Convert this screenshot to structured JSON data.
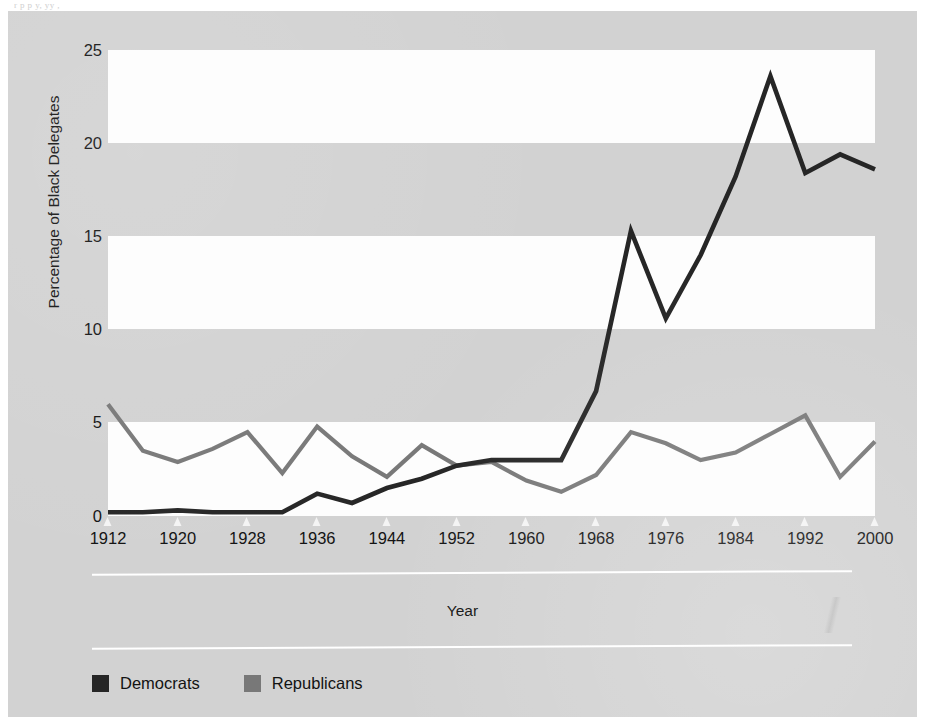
{
  "figure": {
    "background_color": "#d2d2d2",
    "plot_band_white": "#fdfdfd",
    "plot_band_gray": "#d2d2d2",
    "bleed_through_text": "r p             p              y, yy       ,"
  },
  "axes": {
    "y_title": "Percentage of Black Delegates",
    "y_ticks": [
      "25",
      "20",
      "15",
      "10",
      "5",
      "0"
    ],
    "x_title": "Year",
    "x_ticks": [
      "1912",
      "1920",
      "1928",
      "1936",
      "1944",
      "1952",
      "1960",
      "1968",
      "1976",
      "1984",
      "1992",
      "2000"
    ]
  },
  "legend": {
    "items": [
      {
        "label": "Democrats",
        "color": "#262626"
      },
      {
        "label": "Republicans",
        "color": "#787878"
      }
    ]
  },
  "chart_data": {
    "type": "line",
    "title": "",
    "subtitle": "",
    "xlabel": "Year",
    "ylabel": "Percentage of Black Delegates",
    "xlim": [
      1912,
      2000
    ],
    "ylim": [
      0,
      25
    ],
    "yticks": [
      0,
      5,
      10,
      15,
      20,
      25
    ],
    "xticks": [
      1912,
      1920,
      1928,
      1936,
      1944,
      1952,
      1960,
      1968,
      1976,
      1984,
      1992,
      2000
    ],
    "grid": "alternating horizontal bands (white / gray) every 5 units",
    "legend_position": "below plot, lower-left",
    "x": [
      1912,
      1916,
      1920,
      1924,
      1928,
      1932,
      1936,
      1940,
      1944,
      1948,
      1952,
      1956,
      1960,
      1964,
      1968,
      1972,
      1976,
      1980,
      1984,
      1988,
      1992,
      1996,
      2000
    ],
    "series": [
      {
        "name": "Democrats",
        "color": "#262626",
        "values": [
          0.2,
          0.2,
          0.3,
          0.2,
          0.2,
          0.2,
          1.2,
          0.7,
          1.5,
          2.0,
          2.7,
          3.0,
          3.0,
          3.0,
          6.7,
          15.3,
          10.6,
          14.0,
          18.2,
          23.6,
          18.4,
          19.4,
          18.6
        ]
      },
      {
        "name": "Republicans",
        "color": "#787878",
        "values": [
          6.0,
          3.5,
          2.9,
          3.6,
          4.5,
          2.3,
          4.8,
          3.2,
          2.1,
          3.8,
          2.7,
          2.9,
          1.9,
          1.3,
          2.2,
          4.5,
          3.9,
          3.0,
          3.4,
          4.4,
          5.4,
          2.1,
          4.0
        ]
      }
    ]
  }
}
